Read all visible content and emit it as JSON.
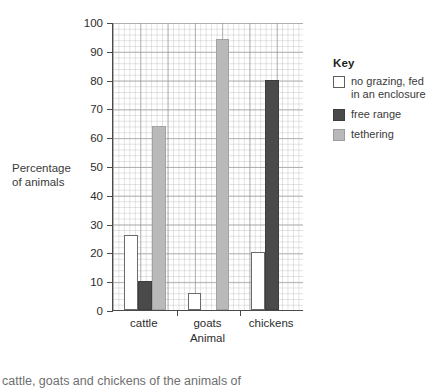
{
  "chart_data": {
    "type": "bar",
    "title": "",
    "xlabel": "Animal",
    "ylabel": "Percentage of animals",
    "ylim": [
      0,
      100
    ],
    "ytick_step": 10,
    "grid": true,
    "legend_position": "right",
    "categories": [
      "cattle",
      "goats",
      "chickens"
    ],
    "series": [
      {
        "name": "no grazing, fed in an enclosure",
        "color": "#ffffff",
        "values": [
          26,
          6,
          20
        ]
      },
      {
        "name": "free range",
        "color": "#4a4a4a",
        "values": [
          10,
          0,
          80
        ]
      },
      {
        "name": "tethering",
        "color": "#b9b9b9",
        "values": [
          64,
          94,
          0
        ]
      }
    ],
    "ytick_labels": [
      "0",
      "10",
      "20",
      "30",
      "40",
      "50",
      "60",
      "70",
      "80",
      "90",
      "100"
    ]
  },
  "axis": {
    "y_title_line1": "Percentage",
    "y_title_line2": "of animals",
    "x_title": "Animal"
  },
  "legend": {
    "title": "Key",
    "items": [
      {
        "label_line1": "no grazing, fed",
        "label_line2": "in an enclosure",
        "swatch": "white"
      },
      {
        "label_line1": "free range",
        "label_line2": "",
        "swatch": "dark"
      },
      {
        "label_line1": "tethering",
        "label_line2": "",
        "swatch": "light"
      }
    ]
  },
  "caption": {
    "text": "cattle, goats and chickens of the animals of"
  }
}
